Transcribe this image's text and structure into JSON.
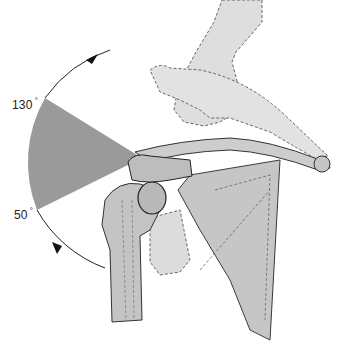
{
  "figure": {
    "angle_upper_label": "130",
    "angle_lower_label": "50",
    "degree_symbol": "°",
    "colors": {
      "wedge": "#9a9a9a",
      "bone_fill": "#c9c9c9",
      "ghost_fill": "#dedede",
      "outline": "#4a4a4a",
      "arc": "#222222"
    }
  }
}
